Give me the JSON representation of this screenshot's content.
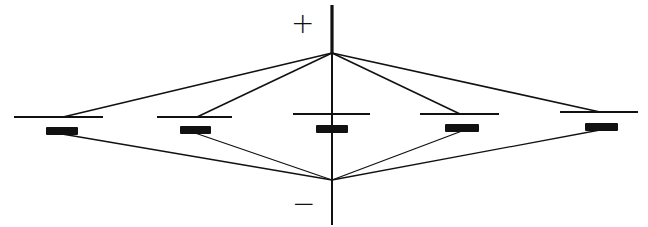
{
  "diagram": {
    "labels": {
      "positive": "+",
      "negative": "−"
    },
    "colors": {
      "stroke": "#111111",
      "background": "#ffffff"
    },
    "axis": {
      "x": 332,
      "y_top": 5,
      "y_bottom": 225
    },
    "top_node": {
      "x": 332,
      "y": 53
    },
    "bottom_node": {
      "x": 332,
      "y": 180
    },
    "units": [
      {
        "plate": {
          "x1": 14,
          "x2": 103,
          "y": 117
        },
        "bar": {
          "x1": 46,
          "x2": 78,
          "y": 131
        },
        "top_conn_x": 63,
        "bottom_conn_x": 62
      },
      {
        "plate": {
          "x1": 157,
          "x2": 232,
          "y": 117
        },
        "bar": {
          "x1": 180,
          "x2": 211,
          "y": 130
        },
        "top_conn_x": 197,
        "bottom_conn_x": 195
      },
      {
        "plate": {
          "x1": 293,
          "x2": 370,
          "y": 114
        },
        "bar": {
          "x1": 316,
          "x2": 348,
          "y": 129
        },
        "top_conn_x": 332,
        "bottom_conn_x": 332
      },
      {
        "plate": {
          "x1": 420,
          "x2": 499,
          "y": 114
        },
        "bar": {
          "x1": 445,
          "x2": 479,
          "y": 128
        },
        "top_conn_x": 460,
        "bottom_conn_x": 462
      },
      {
        "plate": {
          "x1": 560,
          "x2": 638,
          "y": 112
        },
        "bar": {
          "x1": 585,
          "x2": 618,
          "y": 127
        },
        "top_conn_x": 600,
        "bottom_conn_x": 600
      }
    ]
  }
}
